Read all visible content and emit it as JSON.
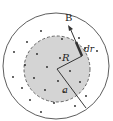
{
  "diagram": {
    "labels": {
      "B": "B",
      "R": "R",
      "a": "a",
      "dr": "dr"
    },
    "colors": {
      "background": "#ffffff",
      "inner_fill": "#d4d4d4",
      "stroke": "#333333",
      "dot": "#222222"
    },
    "outer_circle": {
      "cx": 56,
      "cy": 66,
      "r": 53
    },
    "inner_circle": {
      "cx": 57,
      "cy": 69,
      "r": 33
    },
    "dots": [
      [
        41,
        31
      ],
      [
        27,
        42
      ],
      [
        62,
        39
      ],
      [
        79,
        38
      ],
      [
        14,
        52
      ],
      [
        37,
        54
      ],
      [
        85,
        48
      ],
      [
        97,
        51
      ],
      [
        60,
        58
      ],
      [
        47,
        67
      ],
      [
        70,
        71
      ],
      [
        25,
        65
      ],
      [
        34,
        78
      ],
      [
        13,
        77
      ],
      [
        58,
        81
      ],
      [
        80,
        82
      ],
      [
        45,
        90
      ],
      [
        22,
        88
      ],
      [
        30,
        100
      ],
      [
        64,
        92
      ],
      [
        86,
        96
      ],
      [
        54,
        103
      ],
      [
        75,
        106
      ],
      [
        41,
        112
      ]
    ]
  }
}
